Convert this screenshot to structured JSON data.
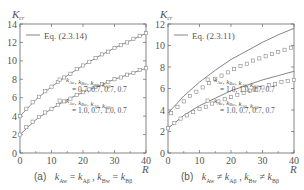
{
  "chart_data": [
    {
      "type": "line",
      "panel": "(a)",
      "caption": "k_Aw = k_Aβ , k_Bw = k_Bβ",
      "ylabel": "K_cr",
      "xlabel": "R",
      "xlim": [
        0,
        40
      ],
      "ylim": [
        0,
        14
      ],
      "xticks": [
        0,
        10,
        20,
        30,
        40
      ],
      "yticks": [
        0,
        2,
        4,
        6,
        8,
        10,
        12,
        14
      ],
      "grid": false,
      "legend": [
        {
          "label": "Eq. (2.3.14)",
          "style": "line"
        },
        {
          "label": "k_Aw, k_Bw, k_Aβ, k_Aβ = 0.7, 0.7, 0.7, 0.7",
          "style": "square"
        },
        {
          "label": "k_Aw, k_Bw, k_Aβ, k_Aβ = 1.0, 0.7, 1.0, 0.7",
          "style": "square"
        }
      ],
      "series": [
        {
          "name": "Eq. (2.3.14) upper",
          "style": "line",
          "x": [
            0,
            5,
            10,
            15,
            20,
            25,
            30,
            35,
            40
          ],
          "y": [
            4.0,
            5.8,
            7.2,
            8.4,
            9.5,
            10.5,
            11.4,
            12.2,
            13.0
          ]
        },
        {
          "name": "Eq. (2.3.14) lower",
          "style": "line",
          "x": [
            0,
            5,
            10,
            15,
            20,
            25,
            30,
            35,
            40
          ],
          "y": [
            2.0,
            3.6,
            4.8,
            5.8,
            6.6,
            7.3,
            8.0,
            8.6,
            9.2
          ]
        },
        {
          "name": "0.7, 0.7, 0.7, 0.7",
          "style": "square",
          "x": [
            0,
            2,
            4,
            6,
            8,
            10,
            12,
            14,
            16,
            18,
            20,
            22,
            24,
            26,
            28,
            30,
            32,
            34,
            36,
            38,
            40
          ],
          "y": [
            4.0,
            4.8,
            5.5,
            6.1,
            6.7,
            7.2,
            7.7,
            8.2,
            8.6,
            9.1,
            9.5,
            9.9,
            10.3,
            10.7,
            11.0,
            11.4,
            11.7,
            12.0,
            12.4,
            12.7,
            13.0
          ]
        },
        {
          "name": "1.0, 0.7, 1.0, 0.7",
          "style": "square",
          "x": [
            0,
            2,
            4,
            6,
            8,
            10,
            12,
            14,
            16,
            18,
            20,
            22,
            24,
            26,
            28,
            30,
            32,
            34,
            36,
            38,
            40
          ],
          "y": [
            2.0,
            2.8,
            3.4,
            3.9,
            4.4,
            4.8,
            5.2,
            5.6,
            5.9,
            6.3,
            6.6,
            6.9,
            7.2,
            7.5,
            7.7,
            8.0,
            8.2,
            8.5,
            8.7,
            9.0,
            9.2
          ]
        }
      ]
    },
    {
      "type": "line",
      "panel": "(b)",
      "caption": "k_Aw ≠ k_Aβ , k_Bw ≠ k_Bβ",
      "ylabel": "K_cr",
      "xlabel": "R",
      "xlim": [
        0,
        40
      ],
      "ylim": [
        0,
        12
      ],
      "xticks": [
        0,
        10,
        20,
        30,
        40
      ],
      "yticks": [
        0,
        2,
        4,
        6,
        8,
        10,
        12
      ],
      "grid": false,
      "legend": [
        {
          "label": "Eq. (2.3.11)",
          "style": "line"
        },
        {
          "label": "k_Aw, k_Bw, k_Aβ, k_Aβ = 1.0, 1.0, 0.7, 0.7",
          "style": "square"
        },
        {
          "label": "k_Aw, k_Bw, k_Aβ, k_Aβ = 1.0, 0.7, 0.7, 0.7",
          "style": "square"
        }
      ],
      "series": [
        {
          "name": "Eq. (2.3.11) upper",
          "style": "line",
          "x": [
            0,
            5,
            10,
            15,
            20,
            25,
            30,
            35,
            40
          ],
          "y": [
            3.7,
            5.3,
            6.6,
            7.7,
            8.7,
            9.5,
            10.3,
            11.0,
            11.6
          ]
        },
        {
          "name": "Eq. (2.3.11) lower",
          "style": "line",
          "x": [
            0,
            5,
            10,
            15,
            20,
            25,
            30,
            35,
            40
          ],
          "y": [
            2.3,
            3.5,
            4.4,
            5.1,
            5.8,
            6.3,
            6.8,
            7.2,
            7.6
          ]
        },
        {
          "name": "1.0, 1.0, 0.7, 0.7",
          "style": "square",
          "x": [
            1,
            3,
            5,
            7,
            9,
            11,
            13,
            15,
            17,
            19,
            21,
            23,
            25,
            27,
            29,
            31,
            33,
            35,
            37,
            39
          ],
          "y": [
            3.7,
            4.3,
            4.8,
            5.3,
            5.7,
            6.1,
            6.5,
            6.9,
            7.2,
            7.5,
            7.8,
            8.1,
            8.3,
            8.6,
            8.8,
            9.0,
            9.2,
            9.4,
            9.6,
            9.8
          ]
        },
        {
          "name": "1.0, 0.7, 0.7, 0.7",
          "style": "square",
          "x": [
            0,
            2,
            4,
            6,
            8,
            10,
            12,
            14,
            16,
            18,
            20,
            22,
            24,
            26,
            28,
            30,
            32,
            34,
            36,
            38,
            40
          ],
          "y": [
            2.3,
            2.8,
            3.2,
            3.5,
            3.8,
            4.1,
            4.3,
            4.6,
            4.8,
            5.0,
            5.2,
            5.4,
            5.6,
            5.8,
            5.9,
            6.1,
            6.3,
            6.4,
            6.6,
            6.7,
            6.8
          ]
        }
      ]
    }
  ],
  "panels": {
    "a": {
      "caption_label": "(a)"
    },
    "b": {
      "caption_label": "(b)"
    }
  }
}
